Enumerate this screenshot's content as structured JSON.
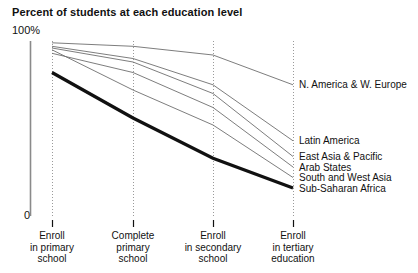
{
  "chart_data": {
    "type": "line",
    "title": "Percent of students at each education level",
    "xlabel": "",
    "ylabel": "Percent of students",
    "ylim": [
      0,
      100
    ],
    "ytick_labels": [
      "100%",
      "0"
    ],
    "grid": "vertical dotted gridlines at each category",
    "legend": "inline labels at right end of each line",
    "categories": [
      "Enroll in primary school",
      "Complete primary school",
      "Enroll in secondary school",
      "Enroll in tertiary education"
    ],
    "category_lines": [
      [
        "Enroll",
        "in primary",
        "school"
      ],
      [
        "Complete",
        "primary",
        "school"
      ],
      [
        "Enroll",
        "in secondary",
        "school"
      ],
      [
        "Enroll",
        "in tertiary",
        "education"
      ]
    ],
    "series": [
      {
        "name": "N. America & W. Europe",
        "values": [
          99,
          97,
          92,
          75
        ],
        "emphasis": "normal"
      },
      {
        "name": "Latin America",
        "values": [
          97,
          90,
          75,
          43
        ],
        "emphasis": "normal"
      },
      {
        "name": "East Asia & Pacific",
        "values": [
          96,
          88,
          70,
          34
        ],
        "emphasis": "normal"
      },
      {
        "name": "Arab States",
        "values": [
          93,
          82,
          62,
          28
        ],
        "emphasis": "normal"
      },
      {
        "name": "South and West Asia",
        "values": [
          95,
          72,
          52,
          22
        ],
        "emphasis": "normal"
      },
      {
        "name": "Sub-Saharan Africa",
        "values": [
          82,
          56,
          33,
          16
        ],
        "emphasis": "bold"
      }
    ]
  },
  "style": {
    "line_color": "#6e6e6e",
    "bold_line_color": "#111111",
    "axis_color": "#8a8a8a",
    "grid_color": "#9a9a9a",
    "text_color": "#111111"
  },
  "geometry": {
    "x_positions": [
      52,
      133,
      213,
      293
    ],
    "y_top": 41,
    "y_bottom": 216
  }
}
